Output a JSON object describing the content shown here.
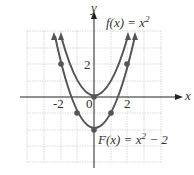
{
  "axes": {
    "x_label": "x",
    "y_label": "y",
    "x_range": [
      -4,
      4
    ],
    "y_range": [
      -4,
      4
    ]
  },
  "ticks": {
    "x": [
      "-2",
      "0",
      "2"
    ],
    "y": [
      "2"
    ]
  },
  "curves": [
    {
      "name": "f",
      "label_fn": "f(x) = x",
      "label_exp": "2",
      "label_tail": "",
      "points": [
        [
          0,
          0
        ]
      ]
    },
    {
      "name": "F",
      "label_fn": "F(x) = x",
      "label_exp": "2",
      "label_tail": " − 2",
      "points": [
        [
          -2,
          2
        ],
        [
          -1,
          -1
        ],
        [
          0,
          -2
        ],
        [
          1,
          -1
        ],
        [
          2,
          2
        ]
      ]
    }
  ],
  "colors": {
    "curve": "#555555",
    "grid": "#cfcfcf",
    "axis": "#222222"
  }
}
